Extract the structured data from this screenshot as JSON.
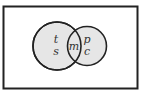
{
  "diagram": {
    "type": "venn",
    "colors": {
      "background": "#ffffff",
      "border": "#222222",
      "fill": "#e6e6e6"
    },
    "sets": [
      {
        "name": "left-circle",
        "labels": [
          "t",
          "s"
        ]
      },
      {
        "name": "right-circle",
        "labels": [
          "p",
          "c"
        ]
      }
    ],
    "intersection": {
      "label": "m"
    }
  }
}
